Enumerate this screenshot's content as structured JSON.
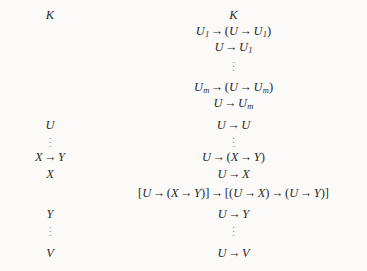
{
  "figure": {
    "background_color": "#fbfaf8",
    "text_color": "#2b2b2b",
    "dots_color": "#8d8a85",
    "arrow": "→",
    "vertical_dots": "⋮"
  },
  "left_column": {
    "name": "premise-column",
    "lines": [
      {
        "id": "l1",
        "text": "K",
        "top": 8,
        "kind": "formula"
      },
      {
        "id": "l2",
        "text": "U",
        "top": 118,
        "kind": "formula"
      },
      {
        "id": "l3",
        "text": "X → Y",
        "top": 150,
        "kind": "formula"
      },
      {
        "id": "l4",
        "text": "X",
        "top": 167,
        "kind": "formula"
      },
      {
        "id": "l5",
        "text": "Y",
        "top": 207,
        "kind": "formula"
      },
      {
        "id": "l6",
        "text": "V",
        "top": 246,
        "kind": "formula"
      }
    ],
    "dot_runs": [
      {
        "id": "ld1",
        "top": 133,
        "left_center": 50
      },
      {
        "id": "ld2",
        "top": 222,
        "left_center": 50
      }
    ]
  },
  "right_column": {
    "name": "derivation-column",
    "lines": [
      {
        "id": "r1",
        "text": "K",
        "top": 8
      },
      {
        "id": "r2",
        "text": "U1 → (U → U1)",
        "top": 24
      },
      {
        "id": "r3",
        "text": "U → U1",
        "top": 40
      },
      {
        "id": "r4",
        "text": "Um → (U → Um)",
        "top": 80
      },
      {
        "id": "r5",
        "text": "U → Um",
        "top": 96
      },
      {
        "id": "r6",
        "text": "U → U",
        "top": 118
      },
      {
        "id": "r7",
        "text": "U → (X → Y)",
        "top": 150
      },
      {
        "id": "r8",
        "text": "U → X",
        "top": 167
      },
      {
        "id": "r9",
        "text": "[U → (X → Y)] → [(U → X) → (U → Y)]",
        "top": 186
      },
      {
        "id": "r10",
        "text": "U → Y",
        "top": 207
      },
      {
        "id": "r11",
        "text": "U → V",
        "top": 246
      }
    ],
    "dot_runs": [
      {
        "id": "rd1",
        "top": 57,
        "left_center": 133
      },
      {
        "id": "rd2",
        "top": 133,
        "left_center": 133
      },
      {
        "id": "rd3",
        "top": 222,
        "left_center": 133
      }
    ]
  }
}
